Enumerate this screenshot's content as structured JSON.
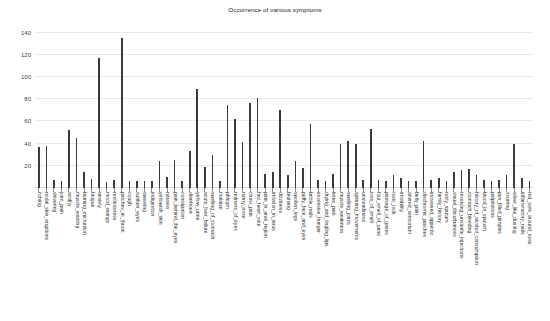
{
  "chart_data": {
    "type": "bar",
    "title": "Occurrence of various symptoms",
    "xlabel": "",
    "ylabel": "",
    "ylim": [
      0,
      145
    ],
    "yticks": [
      0,
      20,
      40,
      60,
      80,
      100,
      120,
      140
    ],
    "grid": true,
    "legend": "none",
    "bar_color": "#3a3a3a",
    "categories": [
      "itching",
      "nodal_skin_eruptions",
      "shivering",
      "joint_pain",
      "acidity",
      "muscle_wasting",
      "burning_micturition",
      "fatigue",
      "anxiety",
      "mood_swings",
      "restlessness",
      "patches_in_throat",
      "cough",
      "sunken_eyes",
      "sweating",
      "indigestion",
      "yellowish_skin",
      "nausea",
      "pain_behind_the_eyes",
      "constipation",
      "diarrhoea",
      "yellow_urine",
      "acute_liver_failure",
      "swelling_of_stomach",
      "malaise",
      "phlegm",
      "redness_of_eyes",
      "runny_nose",
      "chest_pain",
      "fast_heart_rate",
      "pain_in_anal_region",
      "irritation_in_anus",
      "dizziness",
      "bruising",
      "swollen_legs",
      "puffy_face_and_eyes",
      "brittle_nails",
      "excessive_hunger",
      "drying_and_tingling_lips",
      "knee_pain",
      "muscle_weakness",
      "swelling_joints",
      "spinning_movements",
      "unsteadiness",
      "loss_of_smell",
      "foul_smell_of_urine",
      "passage_of_gases",
      "toxic_look",
      "irritability",
      "altered_sensorium",
      "belly_pain",
      "dischromic_patches",
      "increased_appetite",
      "family_history",
      "rusty_sputum",
      "visual_disturbances",
      "receiving_unsterile_injections",
      "stomach_bleeding",
      "history_of_alcohol_consumption",
      "blood_in_sputum",
      "palpitations",
      "pus_filled_pimples",
      "scurring",
      "silver_like_dusting",
      "inflammatory_nails",
      "red_sore_around_nose"
    ],
    "values": [
      37,
      38,
      7,
      6,
      52,
      45,
      14,
      8,
      117,
      5,
      7,
      135,
      6,
      6,
      6,
      6,
      24,
      10,
      25,
      6,
      33,
      89,
      19,
      30,
      6,
      75,
      62,
      41,
      77,
      81,
      13,
      14,
      70,
      12,
      24,
      18,
      58,
      7,
      6,
      13,
      40,
      42,
      40,
      7,
      53,
      7,
      6,
      12,
      9,
      6,
      6,
      42,
      7,
      9,
      6,
      14,
      16,
      17,
      12,
      7,
      6,
      7,
      12,
      40,
      9,
      6
    ]
  }
}
